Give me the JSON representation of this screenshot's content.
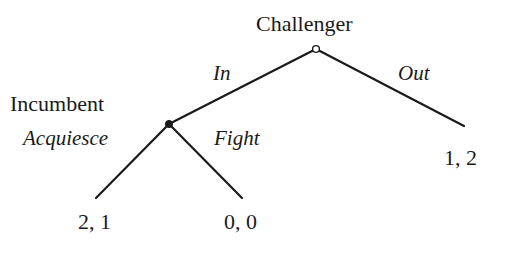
{
  "diagram": {
    "type": "extensive-form-game-tree",
    "players": {
      "root": "Challenger",
      "second": "Incumbent"
    },
    "actions": {
      "challenger_in": "In",
      "challenger_out": "Out",
      "incumbent_acquiesce": "Acquiesce",
      "incumbent_fight": "Fight"
    },
    "payoffs": {
      "out": "1, 2",
      "acquiesce": "2, 1",
      "fight": "0, 0"
    },
    "nodes": [
      {
        "id": "challenger-node",
        "player": "Challenger",
        "style": "open-circle",
        "x": 316,
        "y": 49
      },
      {
        "id": "incumbent-node",
        "player": "Incumbent",
        "style": "filled-dot",
        "x": 169,
        "y": 124
      }
    ],
    "edges": [
      {
        "from": "challenger-node",
        "to": "incumbent-node",
        "action": "In"
      },
      {
        "from": "challenger-node",
        "to": "terminal-out",
        "action": "Out",
        "end": [
          464,
          126
        ]
      },
      {
        "from": "incumbent-node",
        "to": "terminal-acquiesce",
        "action": "Acquiesce",
        "end": [
          96,
          198
        ]
      },
      {
        "from": "incumbent-node",
        "to": "terminal-fight",
        "action": "Fight",
        "end": [
          242,
          198
        ]
      }
    ],
    "colors": {
      "line": "#1a1a1a",
      "text": "#1a1a1a",
      "background": "#ffffff"
    }
  }
}
